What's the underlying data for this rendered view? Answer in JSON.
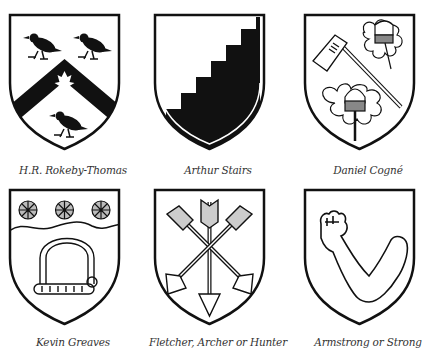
{
  "colors": {
    "ink": "#111111",
    "field": "#ffffff",
    "caption": "#333333"
  },
  "shields": [
    {
      "name": "H.R. Rokeby-Thomas",
      "caption": "H.R. Rokeby-Thomas",
      "charges": [
        "chevron",
        "three ravens",
        "maple leaf"
      ]
    },
    {
      "name": "Arthur Stairs",
      "caption": "Arthur Stairs",
      "charges": [
        "stairs (per bend sinister stepped)"
      ]
    },
    {
      "name": "Daniel Cogné",
      "caption": "Daniel Cogné",
      "charges": [
        "axe",
        "two oak sprigs with acorns"
      ]
    },
    {
      "name": "Kevin Greaves",
      "caption": "Kevin Greaves",
      "charges": [
        "three snowflakes",
        "wavy chief",
        "sled/toboggan"
      ]
    },
    {
      "name": "Fletcher, Archer or Hunter",
      "caption": "Fletcher, Archer or Hunter",
      "charges": [
        "three arrows"
      ]
    },
    {
      "name": "Armstrong or Strong",
      "caption": "Armstrong or Strong",
      "charges": [
        "arm embowed"
      ]
    }
  ]
}
